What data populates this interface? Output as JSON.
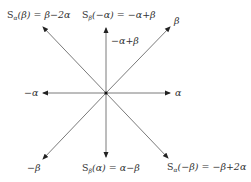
{
  "diagram": {
    "type": "root-system-reflection",
    "center": [
      106,
      93
    ],
    "line_color": "#7a7a7a",
    "arrowhead_color": "#222222",
    "text_color": "#333333",
    "vectors": [
      {
        "id": "alpha",
        "tip": [
          170,
          93
        ],
        "label": "α"
      },
      {
        "id": "neg-alpha",
        "tip": [
          43,
          93
        ],
        "label": "−α"
      },
      {
        "id": "beta",
        "tip": [
          170,
          27
        ],
        "label": "β"
      },
      {
        "id": "neg-beta",
        "tip": [
          43,
          159
        ],
        "label": "−β"
      },
      {
        "id": "s-alpha-beta",
        "tip": [
          43,
          27
        ],
        "label": "Sα(β) = β−2α"
      },
      {
        "id": "s-beta-neg-alpha",
        "tip": [
          106,
          28
        ],
        "label": "Sβ(−α) = −α+β"
      },
      {
        "id": "s-beta-alpha",
        "tip": [
          106,
          157
        ],
        "label": "Sβ(α) = α−β"
      },
      {
        "id": "s-alpha-neg-beta",
        "tip": [
          168,
          158
        ],
        "label": "Sα(−β) = −β+2α"
      }
    ]
  },
  "labels": {
    "alpha": "α",
    "neg_alpha": "−α",
    "beta": "β",
    "neg_beta": "−β",
    "s_alpha_beta": {
      "S": "S",
      "sub": "α",
      "arg": "(β)",
      "rhs": " = β−2α"
    },
    "s_beta_neg_alpha": {
      "S": "S",
      "sub": "β",
      "arg": "(−α)",
      "rhs": " = −α+β"
    },
    "neg_alpha_plus_beta": "−α+β",
    "s_beta_alpha": {
      "S": "S",
      "sub": "β",
      "arg": "(α)",
      "rhs": " = α−β"
    },
    "s_alpha_neg_beta": {
      "S": "S",
      "sub": "α",
      "arg": "(−β)",
      "rhs": " = −β+2α"
    }
  }
}
